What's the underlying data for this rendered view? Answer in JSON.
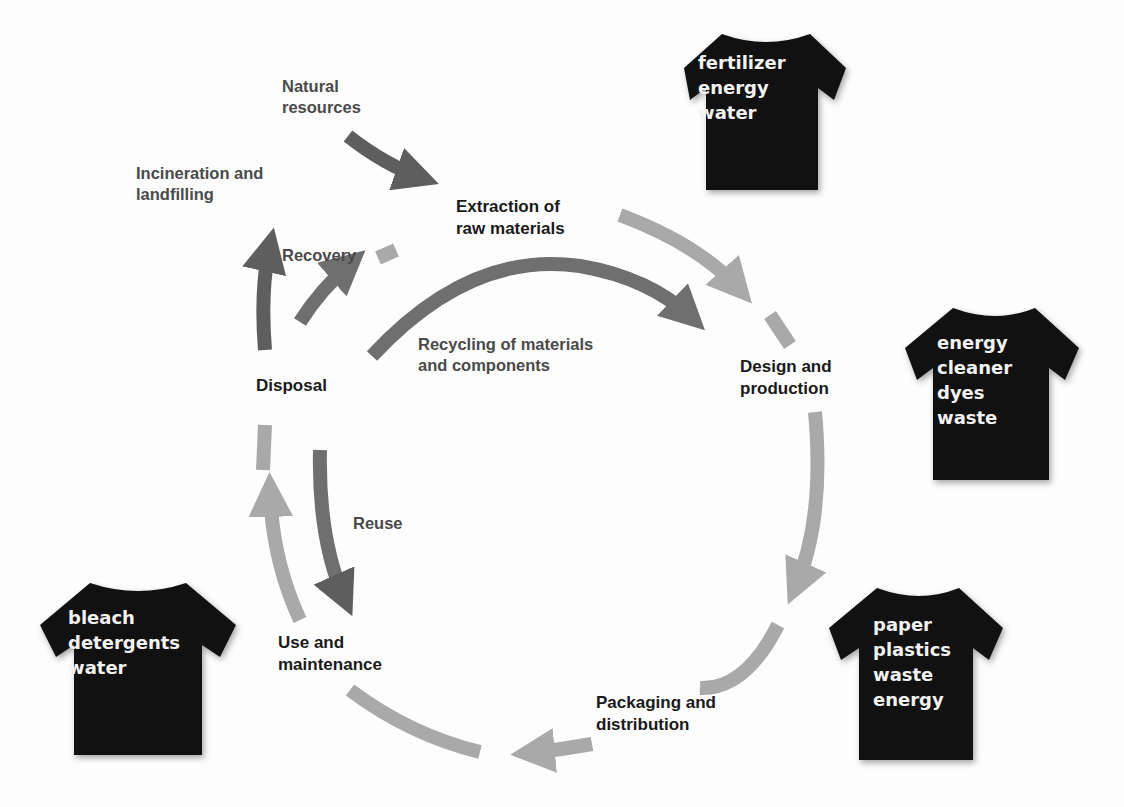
{
  "diagram": {
    "type": "garment life cycle",
    "colors": {
      "main_cycle_arrow": "#a9a9a9",
      "secondary_arrow": "#6f6f6f",
      "dark_arrow": "#5e5e5e",
      "shirt": "#111111",
      "shirt_text": "#f2f2f2",
      "stage_text": "#1a1a1a",
      "flow_text": "#4a4a4a"
    },
    "stages": {
      "extraction": [
        "Extraction of",
        "raw materials"
      ],
      "design": [
        "Design and",
        "production"
      ],
      "packaging": [
        "Packaging and",
        "distribution"
      ],
      "use": [
        "Use and",
        "maintenance"
      ],
      "disposal": [
        "Disposal"
      ]
    },
    "flows": {
      "natural_resources": [
        "Natural",
        "resources"
      ],
      "incineration": [
        "Incineration and",
        "landfilling"
      ],
      "recovery": [
        "Recovery"
      ],
      "recycling": [
        "Recycling of materials",
        "and components"
      ],
      "reuse": [
        "Reuse"
      ]
    },
    "shirts": [
      {
        "stage": "extraction",
        "items": [
          "fertilizer",
          "energy",
          "water"
        ]
      },
      {
        "stage": "design",
        "items": [
          "energy",
          "cleaner",
          "dyes",
          "waste"
        ]
      },
      {
        "stage": "packaging",
        "items": [
          "paper",
          "plastics",
          "waste",
          "energy"
        ]
      },
      {
        "stage": "use",
        "items": [
          "bleach",
          "detergents",
          "water"
        ]
      }
    ]
  }
}
